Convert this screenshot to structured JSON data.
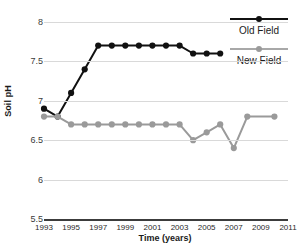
{
  "chart_data": {
    "type": "line",
    "title": "",
    "xlabel": "Time (years)",
    "ylabel": "Soil pH",
    "xlim": [
      1993,
      2011
    ],
    "ylim": [
      5.5,
      8
    ],
    "ytick_labels": [
      "8",
      "7.5",
      "7",
      "6.5",
      "6",
      "5.5"
    ],
    "ytick_values": [
      8,
      7.5,
      7,
      6.5,
      6,
      5.5
    ],
    "xtick_labels": [
      "1993",
      "1995",
      "1997",
      "1999",
      "2001",
      "2003",
      "2005",
      "2007",
      "2009",
      "2011"
    ],
    "xtick_values": [
      1993,
      1995,
      1997,
      1999,
      2001,
      2003,
      2005,
      2007,
      2009,
      2011
    ],
    "grid": true,
    "legend_position": "right",
    "series": [
      {
        "name": "Old Field",
        "color": "#111111",
        "x": [
          1993,
          1994,
          1995,
          1996,
          1997,
          1998,
          1999,
          2000,
          2001,
          2002,
          2003,
          2004,
          2005,
          2006
        ],
        "values": [
          6.9,
          6.8,
          7.1,
          7.4,
          7.7,
          7.7,
          7.7,
          7.7,
          7.7,
          7.7,
          7.7,
          7.6,
          7.6,
          7.6
        ]
      },
      {
        "name": "New Field",
        "color": "#9a9a9a",
        "x": [
          1993,
          1994,
          1995,
          1996,
          1997,
          1998,
          1999,
          2000,
          2001,
          2002,
          2003,
          2004,
          2005,
          2006,
          2007,
          2008,
          2010
        ],
        "values": [
          6.8,
          6.8,
          6.7,
          6.7,
          6.7,
          6.7,
          6.7,
          6.7,
          6.7,
          6.7,
          6.7,
          6.5,
          6.6,
          6.7,
          6.4,
          6.8,
          6.8
        ]
      }
    ]
  },
  "legend": {
    "entries": [
      {
        "label": "Old Field"
      },
      {
        "label": "New Field"
      }
    ]
  },
  "axes": {
    "y_title": "Soil pH",
    "x_title": "Time (years)"
  }
}
